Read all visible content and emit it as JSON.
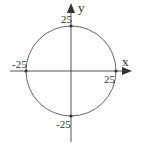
{
  "diagram": {
    "type": "circle-on-axes",
    "axes": {
      "x_label": "x",
      "y_label": "y"
    },
    "circle": {
      "center": [
        0,
        0
      ],
      "radius": 25
    },
    "points": [
      {
        "label": "25",
        "x": 0,
        "y": 25
      },
      {
        "label": "-25",
        "x": -25,
        "y": 0
      },
      {
        "label": "25",
        "x": 25,
        "y": 0
      },
      {
        "label": "-25",
        "x": 0,
        "y": -25
      }
    ],
    "colors": {
      "line": "#555555",
      "text": "#333333"
    }
  }
}
